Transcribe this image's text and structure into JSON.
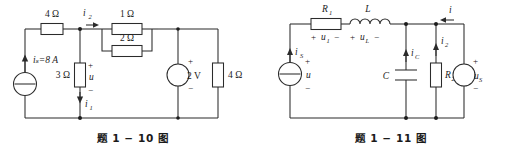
{
  "figures": [
    {
      "id": "fig-1-10",
      "caption": "题 1 − 10 图",
      "components": {
        "source_current": "iₛ=8 A",
        "r_top": "4 Ω",
        "r_shunt": "3 Ω",
        "r_parallel_top": "1 Ω",
        "r_parallel_bottom": "2 Ω",
        "v_source": "2 V",
        "r_right": "4 Ω"
      },
      "labels": {
        "i2": "i",
        "i2_sub": "2",
        "i1": "i",
        "i1_sub": "1",
        "u": "u",
        "plus": "+",
        "minus": "−"
      }
    },
    {
      "id": "fig-1-11",
      "caption": "题 1 − 11 图",
      "components": {
        "source_current": "i",
        "source_current_sub": "S",
        "r1": "R",
        "r1_sub": "1",
        "inductor": "L",
        "capacitor": "C",
        "r2": "R",
        "r2_sub": "2",
        "v_source": "u",
        "v_source_sub": "S"
      },
      "labels": {
        "u": "u",
        "u1": "u",
        "u1_sub": "1",
        "uL": "u",
        "uL_sub": "L",
        "iC": "i",
        "iC_sub": "C",
        "i2": "i",
        "i2_sub": "2",
        "i": "i",
        "plus": "+",
        "minus": "−"
      }
    }
  ],
  "colors": {
    "ink": "#2b2b2b",
    "text": "#1c1c1c",
    "background": "#ffffff"
  }
}
